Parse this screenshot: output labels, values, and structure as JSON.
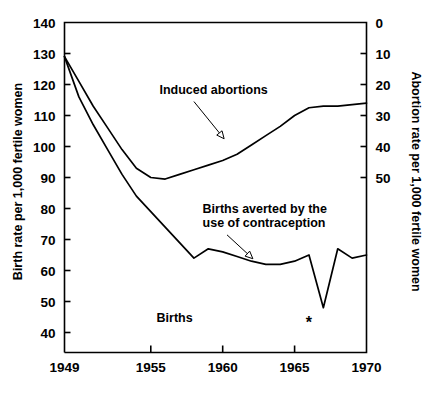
{
  "chart_data": {
    "type": "line",
    "title": "",
    "xlabel": "",
    "ylabel": "Birth rate per 1,000 fertile women",
    "y2label": "Abortion rate per 1,000 fertile women",
    "xlim": [
      1949,
      1970
    ],
    "ylim": [
      33,
      140
    ],
    "y2lim": [
      0,
      70
    ],
    "grid": false,
    "legend": "annotations-inline",
    "xticks": [
      "1949",
      "1955",
      "1960",
      "1965",
      "1970"
    ],
    "xtick_values": [
      1949,
      1955,
      1960,
      1965,
      1970
    ],
    "yticks": [
      "140",
      "130",
      "120",
      "110",
      "100",
      "90",
      "80",
      "70",
      "60",
      "50",
      "40"
    ],
    "ytick_values": [
      140,
      130,
      120,
      110,
      100,
      90,
      80,
      70,
      60,
      50,
      40
    ],
    "y2ticks": [
      "0",
      "10",
      "20",
      "30",
      "40",
      "50"
    ],
    "y2tick_values": [
      0,
      10,
      20,
      30,
      40,
      50
    ],
    "series": [
      {
        "name": "Induced abortions",
        "axis": "right",
        "x": [
          1949,
          1950,
          1951,
          1952,
          1953,
          1954,
          1955,
          1956,
          1957,
          1958,
          1959,
          1960,
          1961,
          1962,
          1963,
          1964,
          1965,
          1966,
          1967,
          1968,
          1969,
          1970
        ],
        "values_left_scale": [
          129,
          121,
          113,
          106,
          99,
          93,
          90,
          89.5,
          91,
          92.5,
          94,
          95.5,
          97.5,
          100.5,
          103.5,
          106.5,
          110,
          112.5,
          113,
          113,
          113.5,
          114
        ],
        "values": [
          11,
          19,
          27,
          34,
          41,
          47,
          50,
          50.5,
          49,
          47.5,
          46,
          44.5,
          42.5,
          39.5,
          36.5,
          33.5,
          30,
          27.5,
          27,
          27,
          26.5,
          26
        ]
      },
      {
        "name": "Births averted by the use of contraception",
        "axis": "left",
        "x": [
          1949,
          1950,
          1951,
          1952,
          1953,
          1954,
          1955,
          1956,
          1957,
          1958,
          1959,
          1960,
          1961,
          1962,
          1963,
          1964,
          1965,
          1966,
          1967,
          1968,
          1969,
          1970
        ],
        "values": [
          129,
          116,
          107,
          99,
          91,
          84,
          79,
          74,
          69,
          64,
          67,
          66,
          64.5,
          63,
          62,
          62,
          63,
          65,
          48,
          67,
          64,
          65
        ]
      }
    ],
    "annotations": [
      {
        "text": "Induced abortions",
        "x": 1955.6,
        "y": 117
      },
      {
        "text": "Births averted by the",
        "x": 1958.6,
        "y": 78.5
      },
      {
        "text": "use of contraception",
        "x": 1958.6,
        "y": 74.0
      },
      {
        "text": "Births",
        "x": 1955.4,
        "y": 43.5
      },
      {
        "text": "*",
        "x": 1966,
        "y": 41.5
      }
    ]
  },
  "axes": {
    "left_title": "Birth rate per 1,000 fertile women",
    "right_title": "Abortion rate per 1,000 fertile women",
    "y_labels": [
      "140",
      "130",
      "120",
      "110",
      "100",
      "90",
      "80",
      "70",
      "60",
      "50",
      "40"
    ],
    "y2_labels": [
      "0",
      "10",
      "20",
      "30",
      "40",
      "50"
    ],
    "x_labels": [
      "1949",
      "1955",
      "1960",
      "1965",
      "1970"
    ]
  },
  "labels": {
    "induced_abortions": "Induced abortions",
    "births_averted_line1": "Births averted by the",
    "births_averted_line2": "use of contraception",
    "births": "Births",
    "footnote_marker": "*"
  },
  "colors": {
    "background": "#ffffff",
    "ink": "#000000"
  }
}
